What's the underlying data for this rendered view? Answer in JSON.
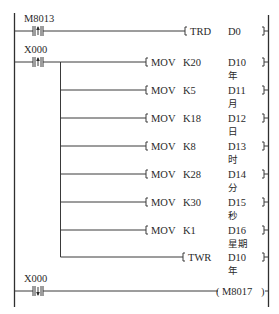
{
  "diagram": {
    "type": "plc-ladder",
    "left_rail": {
      "x": 14.5,
      "y1": 13,
      "y2": 307
    },
    "right_rail": {
      "x": 268.5,
      "y1": 15,
      "y2": 307
    },
    "rungs": [
      {
        "id": "rung-1",
        "y": 31,
        "contact": {
          "label": "M8013",
          "type": "rising-edge",
          "x": 38
        },
        "instruction": {
          "op": "TRD",
          "operands": [
            "D0"
          ],
          "bracket_x": 185,
          "op_x": 190,
          "operand_x": 228,
          "sub": ""
        }
      },
      {
        "id": "rung-2",
        "y": 62,
        "contact": {
          "label": "X000",
          "type": "rising-edge",
          "x": 38
        },
        "branch_x": 60.5,
        "branches": [
          {
            "y": 62,
            "op": "MOV",
            "src": "K20",
            "dst": "D10",
            "sub": "年",
            "bracket_x": 146
          },
          {
            "y": 90,
            "op": "MOV",
            "src": "K5",
            "dst": "D11",
            "sub": "月",
            "bracket_x": 146
          },
          {
            "y": 118,
            "op": "MOV",
            "src": "K18",
            "dst": "D12",
            "sub": "日",
            "bracket_x": 146
          },
          {
            "y": 146,
            "op": "MOV",
            "src": "K8",
            "dst": "D13",
            "sub": "时",
            "bracket_x": 146
          },
          {
            "y": 174,
            "op": "MOV",
            "src": "K28",
            "dst": "D14",
            "sub": "分",
            "bracket_x": 146
          },
          {
            "y": 202,
            "op": "MOV",
            "src": "K30",
            "dst": "D15",
            "sub": "秒",
            "bracket_x": 146
          },
          {
            "y": 230,
            "op": "MOV",
            "src": "K1",
            "dst": "D16",
            "sub": "星期",
            "bracket_x": 146
          },
          {
            "y": 257,
            "op": "TWR",
            "src": "",
            "dst": "D10",
            "sub": "年",
            "bracket_x": 183
          }
        ]
      },
      {
        "id": "rung-3",
        "y": 291,
        "contact": {
          "label": "X000",
          "type": "falling-edge",
          "x": 38
        },
        "coil": {
          "label": "M8017",
          "open_x": 218,
          "close_x": 262
        }
      }
    ],
    "colors": {
      "line": "#3a3a3a",
      "text": "#2a2a2a",
      "background": "#ffffff"
    }
  }
}
